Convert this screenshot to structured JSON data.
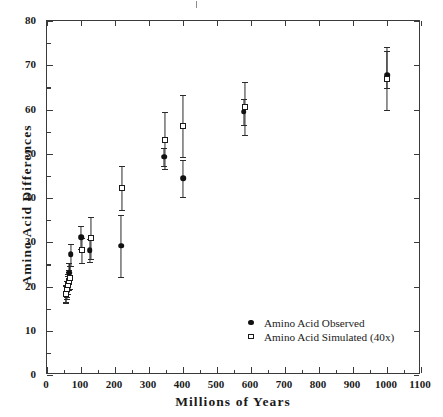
{
  "axes": {
    "x": {
      "title": "Millions of Years",
      "ticks": [
        "0",
        "100",
        "200",
        "300",
        "400",
        "500",
        "600",
        "700",
        "800",
        "900",
        "1000",
        "1100"
      ],
      "min": 0,
      "max": 1100,
      "step": 100
    },
    "y": {
      "title": "Amino Acid Differences",
      "ticks": [
        "0",
        "10",
        "20",
        "30",
        "40",
        "50",
        "60",
        "70",
        "80"
      ],
      "min": 0,
      "max": 80,
      "step": 10
    }
  },
  "legend": {
    "position": "inside-bottom-right",
    "entries": [
      {
        "marker": "filled-circle",
        "label": "Amino Acid Observed"
      },
      {
        "marker": "open-square",
        "label": "Amino Acid Simulated (40x)"
      }
    ]
  },
  "colors": {
    "marker_observed": "#111111",
    "marker_simulated_fill": "#ffffff",
    "marker_simulated_edge": "#1a1a1a",
    "axis": "#3a3a3a",
    "errorbar": "#2a2a2a",
    "background": "#ffffff"
  },
  "chart_data": {
    "type": "scatter",
    "title": "",
    "xlabel": "Millions of Years",
    "ylabel": "Amino Acid Differences",
    "xlim": [
      0,
      1100
    ],
    "ylim": [
      0,
      80
    ],
    "grid": false,
    "legend_position": "inside-bottom-right",
    "errorbars": "vertical",
    "series": [
      {
        "name": "Amino Acid Observed",
        "marker": "filled-circle",
        "points": [
          {
            "x": 55,
            "y": 18.3,
            "ylow": 16.5,
            "yhigh": 20.3
          },
          {
            "x": 60,
            "y": 19.1,
            "ylow": 17.2,
            "yhigh": 21.2
          },
          {
            "x": 62,
            "y": 20.6,
            "ylow": 18.4,
            "yhigh": 22.8
          },
          {
            "x": 64,
            "y": 21.5,
            "ylow": 19.3,
            "yhigh": 23.7
          },
          {
            "x": 66,
            "y": 23.1,
            "ylow": 20.6,
            "yhigh": 25.4
          },
          {
            "x": 70,
            "y": 27.3,
            "ylow": 24.6,
            "yhigh": 29.6
          },
          {
            "x": 100,
            "y": 31.1,
            "ylow": 28.4,
            "yhigh": 33.6
          },
          {
            "x": 125,
            "y": 28.2,
            "ylow": 25.5,
            "yhigh": 30.8
          },
          {
            "x": 218,
            "y": 29.2,
            "ylow": 22.2,
            "yhigh": 36.2
          },
          {
            "x": 345,
            "y": 49.3,
            "ylow": 47.2,
            "yhigh": 51.3
          },
          {
            "x": 400,
            "y": 44.5,
            "ylow": 40.3,
            "yhigh": 48.6
          },
          {
            "x": 578,
            "y": 59.5,
            "ylow": 56.6,
            "yhigh": 62.4
          },
          {
            "x": 1000,
            "y": 67.8,
            "ylow": 64.8,
            "yhigh": 73.2
          }
        ]
      },
      {
        "name": "Amino Acid Simulated (40x)",
        "marker": "open-square",
        "points": [
          {
            "x": 55,
            "y": 18.2,
            "ylow": 16.4,
            "yhigh": 20.1
          },
          {
            "x": 60,
            "y": 19.4,
            "ylow": 17.6,
            "yhigh": 21.3
          },
          {
            "x": 62,
            "y": 20.3,
            "ylow": 18.3,
            "yhigh": 22.3
          },
          {
            "x": 64,
            "y": 21.2,
            "ylow": 19.2,
            "yhigh": 23.2
          },
          {
            "x": 68,
            "y": 22.0,
            "ylow": 19.5,
            "yhigh": 24.6
          },
          {
            "x": 102,
            "y": 28.2,
            "ylow": 25.3,
            "yhigh": 31.0
          },
          {
            "x": 128,
            "y": 31.0,
            "ylow": 26.2,
            "yhigh": 35.8
          },
          {
            "x": 220,
            "y": 42.2,
            "ylow": 37.2,
            "yhigh": 47.2
          },
          {
            "x": 348,
            "y": 53.0,
            "ylow": 46.5,
            "yhigh": 59.4
          },
          {
            "x": 400,
            "y": 56.3,
            "ylow": 49.3,
            "yhigh": 63.3
          },
          {
            "x": 583,
            "y": 60.5,
            "ylow": 54.3,
            "yhigh": 66.3
          },
          {
            "x": 1000,
            "y": 67.0,
            "ylow": 59.8,
            "yhigh": 74.2
          }
        ]
      }
    ]
  }
}
